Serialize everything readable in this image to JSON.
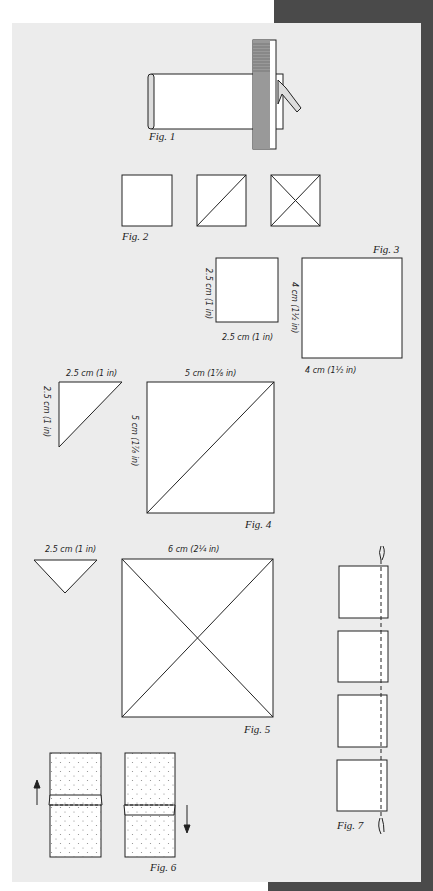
{
  "colors": {
    "background_frame": "#ffffff",
    "dark_band": "#4a4a4a",
    "page": "#ececec",
    "fabric": "#ffffff",
    "line": "#222222"
  },
  "figures": {
    "fig1": {
      "caption": "Fig. 1",
      "description": "Folded fabric strip measured with a ruler and held by a clip"
    },
    "fig2": {
      "caption": "Fig. 2",
      "description": "Three squares: plain, one diagonal, two diagonals"
    },
    "fig3": {
      "caption": "Fig. 3",
      "small_square": {
        "side_label": "2.5 cm (1 in)",
        "bottom_label": "2.5 cm (1 in)"
      },
      "large_square": {
        "side_label": "4 cm (1½ in)",
        "bottom_label": "4 cm (1½ in)"
      }
    },
    "fig4": {
      "caption": "Fig. 4",
      "triangle": {
        "top_label": "2.5 cm (1 in)",
        "side_label": "2.5 cm (1 in)"
      },
      "square": {
        "top_label": "5 cm (1⅞ in)",
        "side_label": "5 cm (1⅞ in)"
      }
    },
    "fig5": {
      "caption": "Fig. 5",
      "triangle": {
        "top_label": "2.5 cm (1 in)"
      },
      "square": {
        "top_label": "6 cm (2¼ in)"
      }
    },
    "fig6": {
      "caption": "Fig. 6",
      "arrows": [
        "arrow-up-icon",
        "arrow-down-icon"
      ]
    },
    "fig7": {
      "caption": "Fig. 7",
      "squares": 4,
      "description": "Squares chain-stitched along a thread"
    }
  }
}
